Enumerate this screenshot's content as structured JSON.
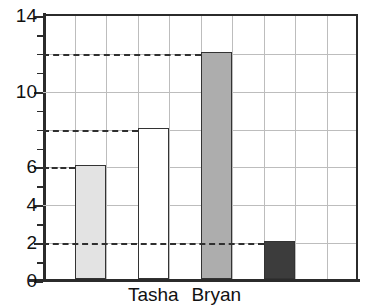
{
  "chart_data": {
    "type": "bar",
    "title": "",
    "xlabel": "",
    "ylabel": "",
    "ylim": [
      0,
      14
    ],
    "ytick_step": 2,
    "yminor_step": 1,
    "grid": true,
    "legend": false,
    "categories": [
      "",
      "Tasha",
      "Bryan",
      ""
    ],
    "values": [
      6,
      8,
      12,
      2
    ],
    "ytick_labels": [
      "0",
      "2",
      "4",
      "6",
      "10",
      "14"
    ],
    "ytick_values": [
      0,
      2,
      4,
      6,
      10,
      14
    ],
    "yminor_values": [
      1,
      3,
      5,
      7,
      8,
      9,
      11,
      12,
      13
    ],
    "gridlines_y": [
      2,
      4,
      6,
      8,
      10,
      12
    ],
    "gridlines_x_count": 10,
    "bar_colors": [
      "#e3e3e3",
      "#ffffff",
      "#adadad",
      "#3c3c3c"
    ],
    "bar_edge_color": "#333333",
    "axis_color": "#2b2b2b",
    "grid_color": "#bdbdbd",
    "leader_line_color": "#2f2f2f",
    "leader_lines": [
      6,
      8,
      12,
      2
    ]
  }
}
